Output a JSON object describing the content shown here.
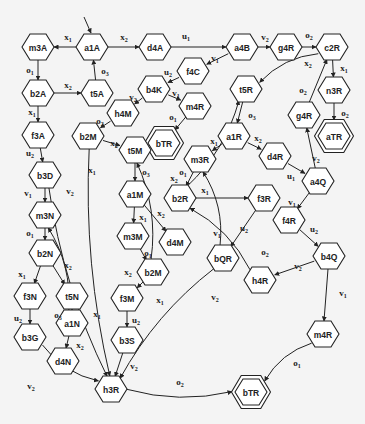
{
  "diagram": {
    "type": "state-transition-graph",
    "nodes": [
      {
        "id": "a1A",
        "label": "a1A",
        "x": 92,
        "y": 47,
        "initial": true
      },
      {
        "id": "m3A",
        "label": "m3A",
        "x": 38,
        "y": 47
      },
      {
        "id": "d4A",
        "label": "d4A",
        "x": 155,
        "y": 47
      },
      {
        "id": "a4B",
        "label": "a4B",
        "x": 242,
        "y": 47
      },
      {
        "id": "g4R_top",
        "label": "g4R",
        "x": 286,
        "y": 47
      },
      {
        "id": "c2R",
        "label": "c2R",
        "x": 332,
        "y": 47
      },
      {
        "id": "b2A",
        "label": "b2A",
        "x": 38,
        "y": 93
      },
      {
        "id": "t5A",
        "label": "t5A",
        "x": 97,
        "y": 93
      },
      {
        "id": "f4C",
        "label": "f4C",
        "x": 193,
        "y": 71
      },
      {
        "id": "b4K",
        "label": "b4K",
        "x": 154,
        "y": 89
      },
      {
        "id": "m4R_top",
        "label": "m4R",
        "x": 195,
        "y": 106
      },
      {
        "id": "h4M",
        "label": "h4M",
        "x": 123,
        "y": 113
      },
      {
        "id": "n3R",
        "label": "n3R",
        "x": 334,
        "y": 90
      },
      {
        "id": "t5R",
        "label": "t5R",
        "x": 246,
        "y": 89
      },
      {
        "id": "g4R_mid",
        "label": "g4R",
        "x": 304,
        "y": 115
      },
      {
        "id": "aTR",
        "label": "aTR",
        "x": 334,
        "y": 136,
        "final": true
      },
      {
        "id": "bTR_top",
        "label": "bTR",
        "x": 164,
        "y": 143,
        "final": true
      },
      {
        "id": "f3A",
        "label": "f3A",
        "x": 38,
        "y": 135
      },
      {
        "id": "b2M_top",
        "label": "b2M",
        "x": 88,
        "y": 136
      },
      {
        "id": "t5M",
        "label": "t5M",
        "x": 135,
        "y": 150
      },
      {
        "id": "a1R",
        "label": "a1R",
        "x": 234,
        "y": 136
      },
      {
        "id": "m3R",
        "label": "m3R",
        "x": 200,
        "y": 159
      },
      {
        "id": "d4R",
        "label": "d4R",
        "x": 275,
        "y": 156
      },
      {
        "id": "a4Q",
        "label": "a4Q",
        "x": 318,
        "y": 181
      },
      {
        "id": "b3D",
        "label": "b3D",
        "x": 45,
        "y": 175
      },
      {
        "id": "a1M",
        "label": "a1M",
        "x": 135,
        "y": 194
      },
      {
        "id": "b2R",
        "label": "b2R",
        "x": 180,
        "y": 198
      },
      {
        "id": "f3R",
        "label": "f3R",
        "x": 264,
        "y": 198
      },
      {
        "id": "f4R",
        "label": "f4R",
        "x": 289,
        "y": 220
      },
      {
        "id": "m3N",
        "label": "m3N",
        "x": 45,
        "y": 215
      },
      {
        "id": "m3M",
        "label": "m3M",
        "x": 133,
        "y": 236
      },
      {
        "id": "d4M",
        "label": "d4M",
        "x": 175,
        "y": 242
      },
      {
        "id": "b2N",
        "label": "b2N",
        "x": 45,
        "y": 253
      },
      {
        "id": "bQR",
        "label": "bQR",
        "x": 223,
        "y": 258
      },
      {
        "id": "b2M_low",
        "label": "b2M",
        "x": 153,
        "y": 272
      },
      {
        "id": "b4Q",
        "label": "b4Q",
        "x": 329,
        "y": 256
      },
      {
        "id": "f3N",
        "label": "f3N",
        "x": 30,
        "y": 296
      },
      {
        "id": "t5N",
        "label": "t5N",
        "x": 72,
        "y": 296
      },
      {
        "id": "f3M",
        "label": "f3M",
        "x": 127,
        "y": 298
      },
      {
        "id": "h4R",
        "label": "h4R",
        "x": 260,
        "y": 280
      },
      {
        "id": "a1N",
        "label": "a1N",
        "x": 72,
        "y": 323
      },
      {
        "id": "b3G",
        "label": "b3G",
        "x": 30,
        "y": 337
      },
      {
        "id": "b3S",
        "label": "b3S",
        "x": 127,
        "y": 340
      },
      {
        "id": "m4R_low",
        "label": "m4R",
        "x": 323,
        "y": 334
      },
      {
        "id": "d4N",
        "label": "d4N",
        "x": 63,
        "y": 361
      },
      {
        "id": "h3R",
        "label": "h3R",
        "x": 111,
        "y": 389
      },
      {
        "id": "bTR_low",
        "label": "bTR",
        "x": 251,
        "y": 392,
        "final": true
      }
    ],
    "edges": [
      {
        "from": "a1A",
        "to": "m3A",
        "label": "x",
        "sub": "1",
        "lx": 68,
        "ly": 37
      },
      {
        "from": "a1A",
        "to": "d4A",
        "label": "x",
        "sub": "2",
        "lx": 124,
        "ly": 37
      },
      {
        "from": "d4A",
        "to": "a4B",
        "label": "u",
        "sub": "1",
        "lx": 186,
        "ly": 36
      },
      {
        "from": "a4B",
        "to": "g4R_top",
        "label": "v",
        "sub": "2",
        "lx": 265,
        "ly": 37
      },
      {
        "from": "g4R_top",
        "to": "c2R",
        "label": "o",
        "sub": "2",
        "lx": 309,
        "ly": 35
      },
      {
        "from": "m3A",
        "to": "b2A",
        "label": "o",
        "sub": "1",
        "lx": 30,
        "ly": 70
      },
      {
        "from": "b2A",
        "to": "t5A",
        "label": "x",
        "sub": "2",
        "lx": 68,
        "ly": 85
      },
      {
        "from": "t5A",
        "to": "a1A",
        "label": "o",
        "sub": "3",
        "lx": 105,
        "ly": 71
      },
      {
        "from": "a4B",
        "to": "f4C",
        "label": "v",
        "sub": "1",
        "lx": 215,
        "ly": 58
      },
      {
        "from": "f4C",
        "to": "b4K",
        "label": "u",
        "sub": "2",
        "lx": 168,
        "ly": 72
      },
      {
        "from": "b4K",
        "to": "h4M",
        "label": "v",
        "sub": "2",
        "lx": 133,
        "ly": 97
      },
      {
        "from": "b4K",
        "to": "m4R_top",
        "label": "v",
        "sub": "1",
        "lx": 176,
        "ly": 93
      },
      {
        "from": "m4R_top",
        "to": "bTR_top",
        "label": "o",
        "sub": "1",
        "lx": 173,
        "ly": 117
      },
      {
        "from": "c2R",
        "to": "n3R",
        "label": "x",
        "sub": "1",
        "lx": 344,
        "ly": 68
      },
      {
        "from": "n3R",
        "to": "aTR",
        "label": "o",
        "sub": "2",
        "lx": 345,
        "ly": 113
      },
      {
        "from": "c2R",
        "to": "t5R",
        "label": "x",
        "sub": "2",
        "lx": 308,
        "ly": 63
      },
      {
        "from": "g4R_mid",
        "to": "c2R",
        "label": "o",
        "sub": "2",
        "lx": 303,
        "ly": 90
      },
      {
        "from": "b2A",
        "to": "f3A",
        "label": "x",
        "sub": "1",
        "lx": 32,
        "ly": 112
      },
      {
        "from": "h4M",
        "to": "b2M_top",
        "label": "o",
        "sub": "2",
        "lx": 100,
        "ly": 121
      },
      {
        "from": "b2M_top",
        "to": "t5M",
        "label": "x",
        "sub": "2",
        "lx": 114,
        "ly": 143
      },
      {
        "from": "t5R",
        "to": "a1R",
        "label": "o",
        "sub": "3",
        "lx": 252,
        "ly": 115
      },
      {
        "from": "a1R",
        "to": "m3R",
        "label": "x",
        "sub": "1",
        "lx": 214,
        "ly": 141
      },
      {
        "from": "a1R",
        "to": "d4R",
        "label": "x",
        "sub": "2",
        "lx": 258,
        "ly": 138
      },
      {
        "from": "d4R",
        "to": "a4Q",
        "label": "u",
        "sub": "1",
        "lx": 291,
        "ly": 176
      },
      {
        "from": "a4Q",
        "to": "g4R_mid",
        "label": "v",
        "sub": "2",
        "lx": 316,
        "ly": 158
      },
      {
        "from": "f3A",
        "to": "b3D",
        "label": "u",
        "sub": "2",
        "lx": 30,
        "ly": 153
      },
      {
        "from": "t5M",
        "to": "a1M",
        "label": "o",
        "sub": "3",
        "lx": 146,
        "ly": 172
      },
      {
        "from": "m3R",
        "to": "b2R",
        "label": "o",
        "sub": "1",
        "lx": 183,
        "ly": 172
      },
      {
        "from": "b2R",
        "to": "f3R",
        "label": "x",
        "sub": "1",
        "lx": 205,
        "ly": 190
      },
      {
        "from": "a4Q",
        "to": "f4R",
        "label": "v",
        "sub": "1",
        "lx": 292,
        "ly": 202
      },
      {
        "from": "b3D",
        "to": "m3N",
        "label": "v",
        "sub": "1",
        "lx": 28,
        "ly": 193
      },
      {
        "from": "a1M",
        "to": "m3M",
        "label": "x",
        "sub": "1",
        "lx": 143,
        "ly": 217
      },
      {
        "from": "a1M",
        "to": "d4M",
        "label": "x",
        "sub": "2",
        "lx": 161,
        "ly": 213
      },
      {
        "from": "f3R",
        "to": "bQR",
        "label": "u",
        "sub": "2",
        "lx": 244,
        "ly": 228
      },
      {
        "from": "bQR",
        "to": "m3R",
        "label": "v",
        "sub": "1",
        "lx": 217,
        "ly": 233
      },
      {
        "from": "f4R",
        "to": "b4Q",
        "label": "u",
        "sub": "2",
        "lx": 314,
        "ly": 229
      },
      {
        "from": "h4R",
        "to": "b2R",
        "label": "o",
        "sub": "2",
        "lx": 265,
        "ly": 252
      },
      {
        "from": "m3N",
        "to": "b2N",
        "label": "o",
        "sub": "1",
        "lx": 30,
        "ly": 233
      },
      {
        "from": "m3M",
        "to": "b2M_low",
        "label": "o",
        "sub": "1",
        "lx": 148,
        "ly": 253
      },
      {
        "from": "b4Q",
        "to": "h4R",
        "label": "v",
        "sub": "2",
        "lx": 298,
        "ly": 266
      },
      {
        "from": "b4Q",
        "to": "m4R_low",
        "label": "v",
        "sub": "1",
        "lx": 343,
        "ly": 293
      },
      {
        "from": "b2N",
        "to": "f3N",
        "label": "x",
        "sub": "1",
        "lx": 22,
        "ly": 274
      },
      {
        "from": "b2N",
        "to": "t5N",
        "label": "x",
        "sub": "2",
        "lx": 68,
        "ly": 265
      },
      {
        "from": "b2M_low",
        "to": "f3M",
        "label": "x",
        "sub": "1",
        "lx": 160,
        "ly": 300
      },
      {
        "from": "t5N",
        "to": "a1N",
        "label": "o",
        "sub": "3",
        "lx": 58,
        "ly": 315
      },
      {
        "from": "f3N",
        "to": "b3G",
        "label": "u",
        "sub": "2",
        "lx": 18,
        "ly": 318
      },
      {
        "from": "f3M",
        "to": "b3S",
        "label": "u",
        "sub": "2",
        "lx": 136,
        "ly": 320
      },
      {
        "from": "a1N",
        "to": "d4N",
        "label": "x",
        "sub": "2",
        "lx": 80,
        "ly": 345
      },
      {
        "from": "b3S",
        "to": "h3R",
        "label": "v",
        "sub": "2",
        "lx": 134,
        "ly": 366
      },
      {
        "from": "b3G",
        "to": "h3R",
        "label": "v",
        "sub": "2",
        "lx": 31,
        "ly": 386
      },
      {
        "from": "h3R",
        "to": "bTR_low",
        "label": "o",
        "sub": "2",
        "lx": 180,
        "ly": 382
      },
      {
        "from": "m4R_low",
        "to": "bTR_low",
        "label": "o",
        "sub": "1",
        "lx": 297,
        "ly": 363
      },
      {
        "from": "b3D",
        "to": "h3R",
        "label": "v",
        "sub": "2",
        "lx": 70,
        "ly": 191
      },
      {
        "from": "b2M_top",
        "to": "h3R",
        "label": "x",
        "sub": "1",
        "lx": 92,
        "ly": 170
      },
      {
        "from": "a1N",
        "to": "m3N",
        "label": "x",
        "sub": "1",
        "lx": 97,
        "ly": 314
      },
      {
        "from": "b2M_low",
        "to": "t5M",
        "label": "x",
        "sub": "2",
        "lx": 128,
        "ly": 272
      },
      {
        "from": "bQR",
        "to": "h3R",
        "label": "v",
        "sub": "2",
        "lx": 215,
        "ly": 297
      },
      {
        "from": "b2R",
        "to": "t5R",
        "label": "x",
        "sub": "2",
        "lx": 174,
        "ly": 178
      }
    ]
  }
}
